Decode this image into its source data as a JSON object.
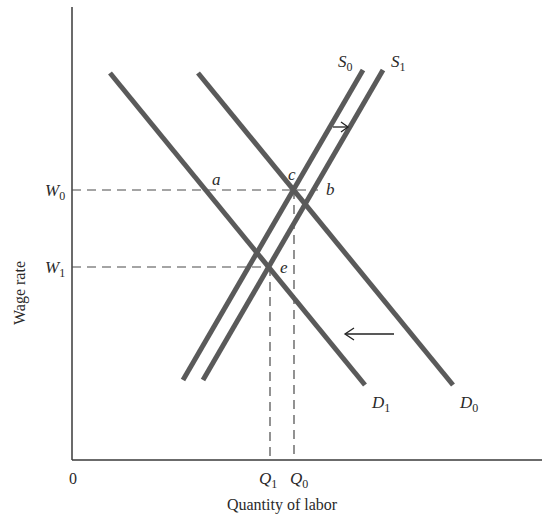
{
  "diagram": {
    "type": "supply-demand-labor-market",
    "axes": {
      "y_label": "Wage rate",
      "x_label": "Quantity of labor",
      "origin_label": "0"
    },
    "wage_levels": [
      {
        "id": "W0",
        "base": "W",
        "sub": "0"
      },
      {
        "id": "W1",
        "base": "W",
        "sub": "1"
      }
    ],
    "quantity_levels": [
      {
        "id": "Q1",
        "base": "Q",
        "sub": "1"
      },
      {
        "id": "Q0",
        "base": "Q",
        "sub": "0"
      }
    ],
    "curves": [
      {
        "id": "S0",
        "base": "S",
        "sub": "0",
        "kind": "supply"
      },
      {
        "id": "S1",
        "base": "S",
        "sub": "1",
        "kind": "supply"
      },
      {
        "id": "D0",
        "base": "D",
        "sub": "0",
        "kind": "demand"
      },
      {
        "id": "D1",
        "base": "D",
        "sub": "1",
        "kind": "demand"
      }
    ],
    "points": {
      "a": "a",
      "b": "b",
      "c": "c",
      "e": "e"
    },
    "arrows": [
      {
        "id": "supply-shift",
        "direction": "right"
      },
      {
        "id": "demand-shift",
        "direction": "left"
      }
    ],
    "colors": {
      "curve": "#5a5a5a",
      "axis": "#3a3a3a",
      "dash": "#4a4a4a",
      "text": "#2a2a2a"
    }
  }
}
